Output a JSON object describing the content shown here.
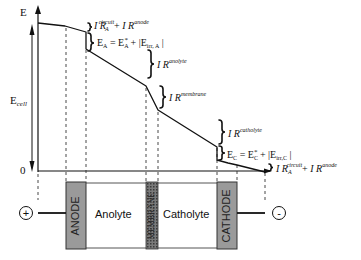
{
  "diagram": {
    "type": "electrochemical cell potential distribution",
    "y_axis": {
      "top_label": "E",
      "cell_label_main": "E",
      "cell_label_sub": "cell",
      "zero_label": "0"
    },
    "annotations": {
      "anode_top": {
        "i1": "I R",
        "sup1": "circuit",
        "sub1": "A",
        "plus": "+",
        "i2": "I R",
        "sup2": "anode"
      },
      "anode_eq": {
        "lhs": "E",
        "lhs_sub": "A",
        "eq": "= E",
        "rhs_sub": "A",
        "rhs_sup": "*",
        "tail": "+ |E",
        "tail_sub": "irr, A",
        "end": "|"
      },
      "anolyte": {
        "text": "I R",
        "sup": "anolyte"
      },
      "membrane": {
        "text": "I R",
        "sup": "membrane"
      },
      "catholyte": {
        "text": "I R",
        "sup": "catholyte"
      },
      "cathode_eq": {
        "lhs": "E",
        "lhs_sub": "C",
        "eq": "= E",
        "rhs_sub": "C",
        "rhs_sup": "*",
        "tail": "+ |E",
        "tail_sub": "irr,C",
        "end": "|"
      },
      "bottom": {
        "i1": "I R",
        "sup1": "circuit",
        "sub1": "A",
        "plus": "+",
        "i2": "I R",
        "sup2": "anode"
      }
    },
    "cell": {
      "anode": "ANODE",
      "anolyte": "Anolyte",
      "membrane": "MEMBRANE",
      "catholyte": "Catholyte",
      "cathode": "CATHODE",
      "positive_terminal": "+",
      "negative_terminal": "-"
    },
    "colors": {
      "line": "#111111",
      "electrode_fill": "#9a9a9a",
      "membrane_fill": "#6a6a6a",
      "background": "#ffffff"
    }
  }
}
